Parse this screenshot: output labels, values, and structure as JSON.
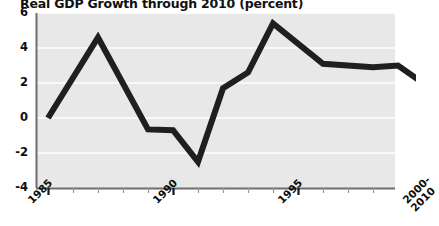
{
  "chart_data": {
    "type": "line",
    "title": "Real GDP Growth through 2010 (percent)",
    "xlabel": "",
    "ylabel": "",
    "ylim": [
      -4,
      6
    ],
    "xlim": [
      1985,
      2000
    ],
    "yticks": [
      6,
      4,
      2,
      0,
      -2,
      -4
    ],
    "ytick_labels": [
      "6",
      "4",
      "2",
      "0",
      "-2",
      "-4"
    ],
    "xticks": [
      1985,
      1990,
      1995,
      2000
    ],
    "xtick_labels": [
      "1985",
      "1990",
      "1995",
      "2000-\n2010"
    ],
    "xtick_labels_flat": [
      "1985",
      "1990",
      "1995",
      "2000-",
      "2010"
    ],
    "grid": true,
    "grid_axis": "y",
    "grid_color": "#ffffff",
    "plot_bg_color": "#e8e8e8",
    "figure_bg_color": "#ffffff",
    "line_color": "#1f1f1f",
    "line_width": 6,
    "legend": null,
    "series": [
      {
        "name": "Real GDP Growth",
        "x": [
          1985,
          1987,
          1989,
          1990,
          1991,
          1992,
          1993,
          1994,
          1996,
          1998,
          1999,
          2000
        ],
        "values": [
          0.0,
          4.6,
          -0.65,
          -0.7,
          -2.5,
          1.7,
          2.6,
          5.4,
          3.1,
          2.9,
          3.0,
          2.0
        ]
      }
    ]
  },
  "axes": {
    "y_axis_name": "percent",
    "x_axis_name": "year"
  }
}
